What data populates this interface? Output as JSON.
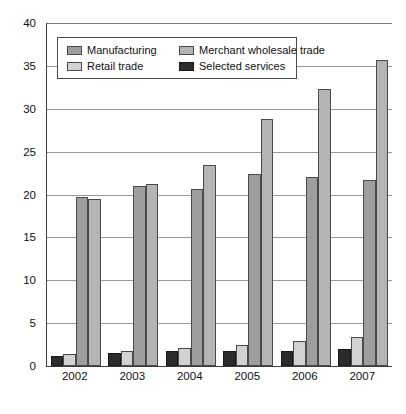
{
  "chart_data": {
    "type": "bar",
    "title": "",
    "xlabel": "",
    "ylabel": "",
    "categories": [
      "2002",
      "2003",
      "2004",
      "2005",
      "2006",
      "2007"
    ],
    "ylim": [
      0,
      40
    ],
    "yticks": [
      0,
      5,
      10,
      15,
      20,
      25,
      30,
      35,
      40
    ],
    "grid": true,
    "legend_position": "top-left-inside",
    "series": [
      {
        "name": "Selected services",
        "color": "#2b2b2b",
        "values": [
          1.2,
          1.5,
          1.7,
          1.7,
          1.8,
          2.0
        ]
      },
      {
        "name": "Retail trade",
        "color": "#d2d2d2",
        "values": [
          1.4,
          1.8,
          2.1,
          2.4,
          2.9,
          3.4
        ]
      },
      {
        "name": "Manufacturing",
        "color": "#9e9e9e",
        "values": [
          19.7,
          21.0,
          20.6,
          22.4,
          22.1,
          21.7
        ]
      },
      {
        "name": "Merchant wholesale trade",
        "color": "#b4b4b4",
        "values": [
          19.5,
          21.2,
          23.5,
          28.8,
          32.3,
          35.7
        ]
      }
    ]
  },
  "legend": {
    "items": [
      {
        "label": "Manufacturing",
        "key": "manufacturing"
      },
      {
        "label": "Merchant wholesale trade",
        "key": "merchant-wholesale"
      },
      {
        "label": "Retail trade",
        "key": "retail-trade"
      },
      {
        "label": "Selected services",
        "key": "selected-services"
      }
    ]
  }
}
